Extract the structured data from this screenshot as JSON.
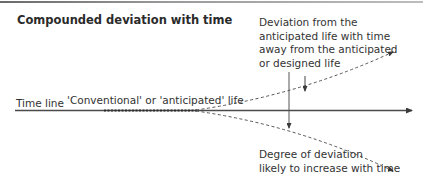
{
  "title": "Compounded deviation with time",
  "labels": {
    "timeline": "Time line",
    "conventional": "'Conventional' or 'anticipated' life",
    "deviation": [
      "Deviation from the",
      "anticipated life with time",
      "away from the anticipated",
      "or designed life"
    ],
    "degree": [
      "Degree of deviation",
      "likely to increase with time"
    ]
  },
  "colors": {
    "line": "#3a3a3a",
    "dashed": "#555555",
    "rule": "#8a8a8a"
  },
  "icons": {
    "timeline_arrow": "arrow-right",
    "upper_branch_arrow": "arrow-up-right",
    "lower_branch_arrow": "arrow-down-right",
    "deviation_marker": "arrow-down",
    "spread_marker": "arrow-down"
  }
}
